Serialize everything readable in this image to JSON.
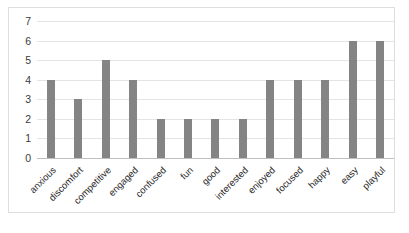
{
  "chart_data": {
    "type": "bar",
    "title": "",
    "subtitle": "",
    "xlabel": "",
    "ylabel": "",
    "ylim": [
      0,
      7
    ],
    "yticks": [
      0,
      1,
      2,
      3,
      4,
      5,
      6,
      7
    ],
    "grid": true,
    "legend": false,
    "legend_position": "none",
    "bar_color": "#848484",
    "plot_border_color": "#dededc",
    "gridline_color": "#e4e4e2",
    "categories": [
      "anxious",
      "discomfort",
      "competitive",
      "engaged",
      "confused",
      "fun",
      "good",
      "interested",
      "enjoyed",
      "focused",
      "happy",
      "easy",
      "playful"
    ],
    "values": [
      4,
      3,
      5,
      4,
      2,
      2,
      2,
      2,
      4,
      4,
      4,
      6,
      6
    ],
    "xtick_rotation": -45
  }
}
